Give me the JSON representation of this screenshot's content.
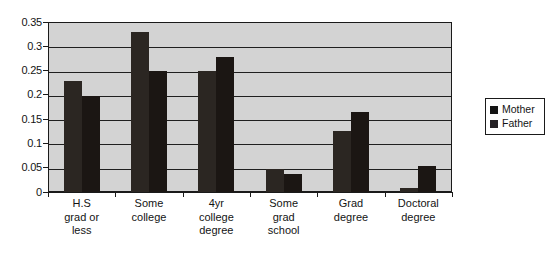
{
  "chart_data": {
    "type": "bar",
    "title": "",
    "xlabel": "",
    "ylabel": "",
    "categories": [
      "H.S\ngrad or\nless",
      "Some\ncollege",
      "4yr\ncollege\ndegree",
      "Some\ngrad\nschool",
      "Grad\ndegree",
      "Doctoral\ndegree"
    ],
    "series": [
      {
        "name": "Mother",
        "color": "#2b2622",
        "values": [
          0.228,
          0.33,
          0.25,
          0.047,
          0.125,
          0.008
        ]
      },
      {
        "name": "Father",
        "color": "#1b1613",
        "values": [
          0.198,
          0.25,
          0.278,
          0.037,
          0.165,
          0.053
        ]
      }
    ],
    "ylim": [
      0,
      0.35
    ],
    "ytick_step": 0.05,
    "ytick_labels": [
      "0",
      "0.05",
      "0.1",
      "0.15",
      "0.2",
      "0.25",
      "0.3",
      "0.35"
    ],
    "ytick_values": [
      0,
      0.05,
      0.1,
      0.15,
      0.2,
      0.25,
      0.3,
      0.35
    ],
    "grid": true,
    "grid_axis": "y",
    "legend_position": "right",
    "plot_background": "#d3d3d3",
    "axis_color": "#1a1a1a"
  },
  "legend": {
    "items": [
      {
        "label": "Mother"
      },
      {
        "label": "Father"
      }
    ]
  }
}
